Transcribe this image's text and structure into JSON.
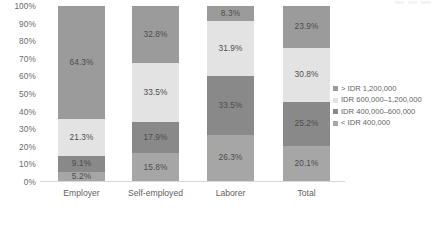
{
  "chart_data": {
    "type": "bar",
    "stacked": true,
    "stack_mode": "percent",
    "title": "",
    "subtitle": "",
    "xlabel": "",
    "ylabel": "",
    "ylim": [
      0,
      100
    ],
    "ytick_labels": [
      "100%",
      "90%",
      "80%",
      "70%",
      "60%",
      "50%",
      "40%",
      "30%",
      "20%",
      "10%",
      "0%"
    ],
    "ytick_values": [
      100,
      90,
      80,
      70,
      60,
      50,
      40,
      30,
      20,
      10,
      0
    ],
    "grid": false,
    "legend_position": "right",
    "categories": [
      "Employer",
      "Self-employed",
      "Laborer",
      "Total"
    ],
    "series": [
      {
        "name": "< IDR 400,000",
        "color": "#a6a6a6",
        "values": [
          5.2,
          15.8,
          26.3,
          20.1
        ],
        "labels": [
          "5.2%",
          "15.8%",
          "26.3%",
          "20.1%"
        ]
      },
      {
        "name": "IDR 400,000–600,000",
        "color": "#898989",
        "values": [
          9.1,
          17.9,
          33.5,
          25.2
        ],
        "labels": [
          "9.1%",
          "17.9%",
          "33.5%",
          "25.2%"
        ]
      },
      {
        "name": "IDR 600,000–1,200,000",
        "color": "#e3e3e3",
        "values": [
          21.3,
          33.5,
          31.9,
          30.8
        ],
        "labels": [
          "21.3%",
          "33.5%",
          "31.9%",
          "30.8%"
        ]
      },
      {
        "name": "> IDR 1,200,000",
        "color": "#9b9b9b",
        "values": [
          64.3,
          32.8,
          8.3,
          23.9
        ],
        "labels": [
          "64.3%",
          "32.8%",
          "8.3%",
          "23.9%"
        ]
      }
    ]
  },
  "axis": {
    "y_ticks": [
      {
        "label": "100%",
        "value": 100
      },
      {
        "label": "90%",
        "value": 90
      },
      {
        "label": "80%",
        "value": 80
      },
      {
        "label": "70%",
        "value": 70
      },
      {
        "label": "60%",
        "value": 60
      },
      {
        "label": "50%",
        "value": 50
      },
      {
        "label": "40%",
        "value": 40
      },
      {
        "label": "30%",
        "value": 30
      },
      {
        "label": "20%",
        "value": 20
      },
      {
        "label": "10%",
        "value": 10
      },
      {
        "label": "0%",
        "value": 0
      }
    ],
    "x_labels": [
      "Employer",
      "Self-employed",
      "Laborer",
      "Total"
    ]
  },
  "legend": {
    "items": [
      {
        "label": "> IDR 1,200,000",
        "color": "#9b9b9b"
      },
      {
        "label": "IDR 600,000–1,200,000",
        "color": "#e3e3e3"
      },
      {
        "label": "IDR 400,000–600,000",
        "color": "#898989"
      },
      {
        "label": "< IDR 400,000",
        "color": "#a6a6a6"
      }
    ]
  },
  "colors": {
    "axis_line": "#d9d9d9",
    "tick_text": "#6b6b6b",
    "label_text": "#4d4d4d",
    "background": "#ffffff"
  }
}
